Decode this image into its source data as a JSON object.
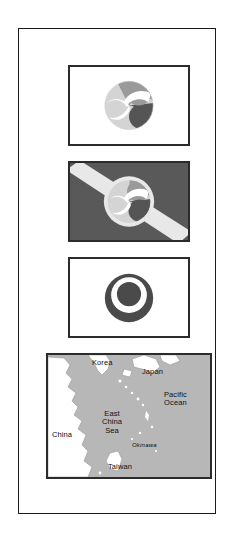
{
  "page": {
    "frame": {
      "border_color": "#1a1a1a",
      "background": "#ffffff"
    }
  },
  "figures": [
    {
      "id": "flag-prefecture",
      "name": "Okinawa Prefecture flag",
      "field_color": "#ffffff",
      "border_color": "#2b2b2b",
      "emblem": "tomoe-circle",
      "emblem_colors": [
        "#d4d4d4",
        "#9a9a9a",
        "#555555"
      ]
    },
    {
      "id": "flag-city",
      "name": "Okinawa City flag",
      "field_color": "#595959",
      "border_color": "#2b2b2b",
      "emblem": "tomoe-circle-with-diagonal-band",
      "band_color": "#e8e8e8",
      "emblem_colors": [
        "#d4d4d4",
        "#9a9a9a",
        "#555555"
      ]
    },
    {
      "id": "flag-town",
      "name": "Okinawa Town flag",
      "field_color": "#ffffff",
      "border_color": "#2b2b2b",
      "emblem": "ring-and-disc",
      "emblem_colors": [
        "#4a4a4a",
        "#ffffff",
        "#4a4a4a"
      ]
    }
  ],
  "map": {
    "name": "East Asia locator map",
    "sea_color": "#b7b7b7",
    "land_color": "#ffffff",
    "border_color": "#2b2b2b",
    "labels": [
      {
        "key": "korea",
        "text": "Korea"
      },
      {
        "key": "japan",
        "text": "Japan"
      },
      {
        "key": "pacific_ocean",
        "text": "Pacific\nOcean"
      },
      {
        "key": "east_china_sea",
        "text": "East\nChina\nSea"
      },
      {
        "key": "china",
        "text": "China"
      },
      {
        "key": "okinawa",
        "text": "Okinawa"
      },
      {
        "key": "taiwan",
        "text": "Taiwan"
      }
    ]
  }
}
